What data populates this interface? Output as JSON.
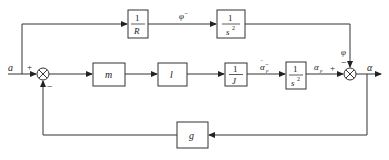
{
  "diagram": {
    "type": "block-diagram",
    "signals": {
      "input": "a",
      "output": "α",
      "top_mid": "φ̈",
      "main_mid": "α̈",
      "main_mid_sub": "p",
      "main_out": "α",
      "main_out_sub": "p",
      "top_into_sum": "φ"
    },
    "blocks": {
      "R": {
        "num": "1",
        "den": "R"
      },
      "s2_top": {
        "num": "1",
        "den": "s",
        "den_sup": "2"
      },
      "m": {
        "label": "m"
      },
      "l": {
        "label": "l"
      },
      "J": {
        "num": "1",
        "den": "J"
      },
      "s2_main": {
        "num": "1",
        "den": "s",
        "den_sup": "2"
      },
      "g": {
        "label": "g"
      }
    },
    "summing_junctions": {
      "sum1": {
        "plus": "+",
        "minus": "−"
      },
      "sum2": {
        "plus": "+",
        "minus": "−"
      }
    },
    "colors": {
      "line": "#333333",
      "background": "#ffffff"
    }
  }
}
